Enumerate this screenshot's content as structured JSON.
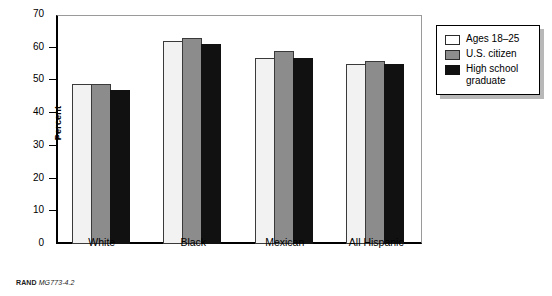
{
  "chart_data": {
    "type": "bar",
    "title": "",
    "xlabel": "",
    "ylabel": "Percent",
    "ylim": [
      0,
      70
    ],
    "yticks": [
      0,
      10,
      20,
      30,
      40,
      50,
      60,
      70
    ],
    "grid": false,
    "legend_position": "right",
    "categories": [
      "White",
      "Black",
      "Mexican",
      "All Hispanic"
    ],
    "series": [
      {
        "name": "Ages 18–25",
        "color": "#f2f2f2",
        "values": [
          49,
          62,
          57,
          55
        ]
      },
      {
        "name": "U.S. citizen",
        "color": "#8c8c8c",
        "values": [
          49,
          63,
          59,
          56
        ]
      },
      {
        "name": "High school\ngraduate",
        "color": "#111111",
        "values": [
          47,
          61,
          57,
          55
        ]
      }
    ]
  },
  "axis": {
    "y_title": "Percent",
    "y_tick_labels": [
      "0",
      "10",
      "20",
      "30",
      "40",
      "50",
      "60",
      "70"
    ]
  },
  "legend": {
    "items": [
      {
        "label": "Ages 18–25"
      },
      {
        "label": "U.S. citizen"
      },
      {
        "label": "High school\ngraduate"
      }
    ]
  },
  "footer": {
    "source": "RAND",
    "document_id": "MG773-4.2"
  }
}
